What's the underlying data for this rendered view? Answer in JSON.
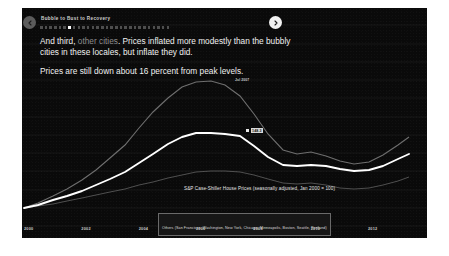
{
  "deck": {
    "title": "Bubble to Bust to Recovery",
    "prev_icon": "chevron-left-icon",
    "next_icon": "chevron-right-icon",
    "dots_total": 28,
    "dots_active_index": 6
  },
  "copy": {
    "para1_a": "And third, ",
    "para1_muted": "other cities",
    "para1_b": ". Prices inflated more modestly than the bubbly cities in these locales, but inflate they did.",
    "para2": "Prices are still down about 16 percent from peak levels."
  },
  "annotations": {
    "peak_label": "Jul 2007",
    "data_label": "148.3"
  },
  "caption": "S&P Case-Shiller House Prices (seasonally adjusted, Jan 2000 = 100)",
  "legend": "Others (San Francisco, Washington, New York, Chicago, Minneapolis, Boston, Seattle, Portland)",
  "chart_data": {
    "type": "line",
    "title": "S&P Case-Shiller House Prices (seasonally adjusted, Jan 2000 = 100)",
    "xlabel": "",
    "ylabel": "",
    "xlim": [
      2000,
      2013.5
    ],
    "ylim": [
      80,
      300
    ],
    "grid": true,
    "legend_position": "bottom-center",
    "y_ticks": [
      300,
      280,
      260,
      240,
      220,
      200,
      180,
      160,
      140,
      120,
      100,
      80
    ],
    "x_ticks": [
      2000,
      2002,
      2004,
      2006,
      2008,
      2010,
      2012
    ],
    "x": [
      2000,
      2000.5,
      2001,
      2001.5,
      2002,
      2002.5,
      2003,
      2003.5,
      2004,
      2004.5,
      2005,
      2005.5,
      2006,
      2006.5,
      2007,
      2007.5,
      2008,
      2008.5,
      2009,
      2009.5,
      2010,
      2010.5,
      2011,
      2011.5,
      2012,
      2012.5,
      2013,
      2013.4
    ],
    "series": [
      {
        "name": "Others (San Francisco, Washington, New York, Chicago, Minneapolis, Boston, Seattle, Portland)",
        "highlight": true,
        "color": "#ffffff",
        "values": [
          100,
          104,
          109,
          114,
          120,
          127,
          134,
          142,
          152,
          163,
          174,
          182,
          186,
          187,
          186,
          183,
          172,
          160,
          150,
          149,
          150,
          149,
          145,
          143,
          144,
          149,
          156,
          162
        ]
      },
      {
        "name": "Bubbly cities",
        "highlight": false,
        "color": "#6e6e6e",
        "values": [
          100,
          106,
          113,
          121,
          131,
          142,
          155,
          170,
          188,
          206,
          222,
          234,
          240,
          241,
          236,
          224,
          203,
          180,
          162,
          158,
          160,
          156,
          150,
          147,
          149,
          157,
          168,
          177
        ]
      },
      {
        "name": "Stable cities",
        "highlight": false,
        "color": "#5a5a5a",
        "values": [
          100,
          102,
          104,
          107,
          110,
          113,
          116,
          119,
          123,
          126,
          130,
          133,
          136,
          137,
          137,
          136,
          133,
          129,
          125,
          124,
          125,
          123,
          120,
          119,
          120,
          123,
          127,
          131
        ]
      }
    ],
    "annotations": [
      {
        "text": "Jul 2007",
        "x": 2007.5,
        "y": 241
      },
      {
        "text": "148.3",
        "x": 2008.6,
        "y": 162
      }
    ]
  }
}
